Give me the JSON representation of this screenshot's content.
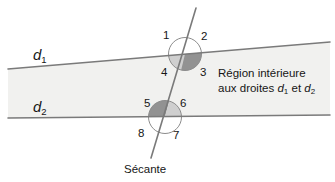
{
  "figure": {
    "type": "geometry-diagram",
    "background_color": "#ffffff",
    "line_color": "#7a7a7a",
    "text_color": "#161616",
    "band_fill_color": "#f1f1ef",
    "shade_light_color": "#c9c9c9",
    "shade_dark_color": "#8f8f8f",
    "circle_stroke_color": "#8c8c8c"
  },
  "lines": {
    "d1": {
      "label": "d",
      "subscript": "1",
      "label_x": 33,
      "label_y": 47,
      "x1": 8,
      "y1": 69,
      "x2": 330,
      "y2": 42
    },
    "d2": {
      "label": "d",
      "subscript": "2",
      "label_x": 33,
      "label_y": 99,
      "x1": 8,
      "y1": 118,
      "x2": 330,
      "y2": 115
    },
    "secante": {
      "label": "Sécante",
      "label_x": 124,
      "label_y": 164,
      "x1": 196,
      "y1": 8,
      "x2": 151,
      "y2": 158
    }
  },
  "intersections": [
    {
      "name": "upper",
      "cx": 185,
      "cy": 54,
      "r": 16.5
    },
    {
      "name": "lower",
      "cx": 165,
      "cy": 117,
      "r": 16.5
    }
  ],
  "angle_labels": [
    {
      "id": "a1",
      "text": "1",
      "x": 163,
      "y": 30
    },
    {
      "id": "a2",
      "text": "2",
      "x": 201,
      "y": 31
    },
    {
      "id": "a3",
      "text": "3",
      "x": 200,
      "y": 67
    },
    {
      "id": "a4",
      "text": "4",
      "x": 161,
      "y": 67
    },
    {
      "id": "a5",
      "text": "5",
      "x": 144,
      "y": 98
    },
    {
      "id": "a6",
      "text": "6",
      "x": 180,
      "y": 98
    },
    {
      "id": "a7",
      "text": "7",
      "x": 173,
      "y": 130
    },
    {
      "id": "a8",
      "text": "8",
      "x": 138,
      "y": 128
    }
  ],
  "region_annotation": {
    "line1": "Région intérieure",
    "line2_prefix": "aux droites ",
    "line2_d1": "d",
    "line2_d1_sub": "1",
    "line2_mid": " et ",
    "line2_d2": "d",
    "line2_d2_sub": "2",
    "x": 218,
    "y": 66
  }
}
